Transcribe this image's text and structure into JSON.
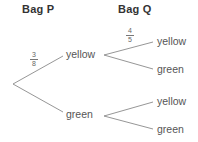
{
  "headers": {
    "bag_p": "Bag P",
    "bag_q": "Bag Q"
  },
  "bag_p_branches": [
    {
      "label": "yellow",
      "probability": {
        "num": "3",
        "den": "8"
      }
    },
    {
      "label": "green"
    }
  ],
  "bag_q_branches": {
    "after_yellow": [
      {
        "label": "yellow",
        "probability": {
          "num": "4",
          "den": "5"
        }
      },
      {
        "label": "green"
      }
    ],
    "after_green": [
      {
        "label": "yellow"
      },
      {
        "label": "green"
      }
    ]
  },
  "colors": {
    "line": "#8a8a8a",
    "text": "#555555",
    "header": "#333333"
  }
}
